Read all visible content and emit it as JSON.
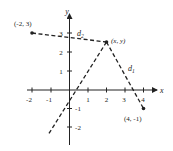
{
  "diagram": {
    "axes": {
      "x_label": "x",
      "y_label": "y",
      "x_ticks": [
        "-2",
        "-1",
        "1",
        "2",
        "3",
        "4"
      ],
      "y_ticks": [
        "3",
        "2",
        "1",
        "-1",
        "-2"
      ]
    },
    "points": {
      "p1": {
        "label": "(-2, 3)",
        "x": -2,
        "y": 3
      },
      "p2": {
        "label": "(4, -1)",
        "x": 4,
        "y": -1
      },
      "p": {
        "label": "(x, y)",
        "x": 2,
        "y": 2.5
      }
    },
    "distances": {
      "d1": {
        "symbol": "d",
        "subscript": "1"
      },
      "d2": {
        "symbol": "d",
        "subscript": "2"
      }
    },
    "colors": {
      "ink": "#222222",
      "background": "#ffffff"
    }
  }
}
